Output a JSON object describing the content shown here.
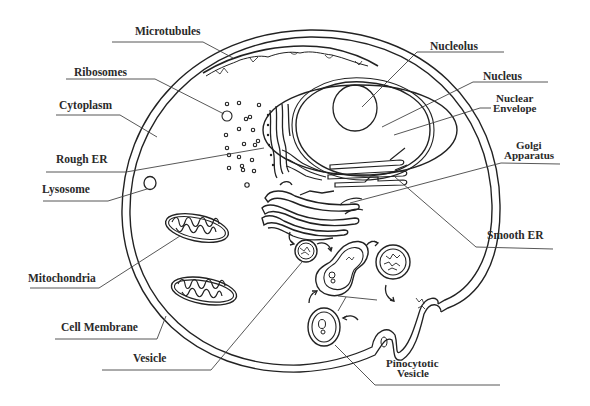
{
  "diagram": {
    "labels": {
      "microtubules": "Microtubules",
      "ribosomes": "Ribosomes",
      "cytoplasm": "Cytoplasm",
      "rough_er": "Rough ER",
      "lysosome": "Lysosome",
      "mitochondria": "Mitochondria",
      "cell_membrane": "Cell Membrane",
      "vesicle": "Vesicle",
      "nucleolus": "Nucleolus",
      "nucleus": "Nucleus",
      "nuclear_envelope_line1": "Nuclear",
      "nuclear_envelope_line2": "Envelope",
      "golgi_line1": "Golgi",
      "golgi_line2": "Apparatus",
      "smooth_er": "Smooth ER",
      "pinocytotic_line1": "Pinocytotic",
      "pinocytotic_line2": "Vesicle"
    },
    "colors": {
      "line": "#222222",
      "text": "#2a2a2a",
      "background": "#ffffff"
    }
  }
}
